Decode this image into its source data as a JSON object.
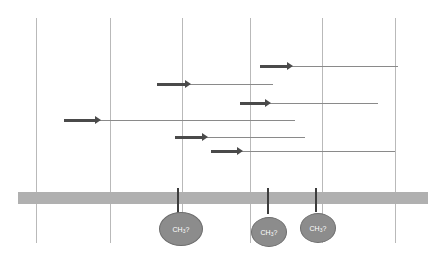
{
  "figure": {
    "type": "sequencing-coverage-diagram",
    "background_color": "#ffffff",
    "width": 444,
    "height": 261
  },
  "gridlines": {
    "color": "#b9b9b9",
    "top": 18,
    "bottom": 243,
    "positions": [
      36,
      110,
      182,
      250,
      322,
      395
    ]
  },
  "membrane": {
    "name": "reference-genome-bar",
    "color": "#b0b0b0",
    "x": 18,
    "y": 192,
    "width": 410,
    "height": 12
  },
  "reads": [
    {
      "id": "read-1",
      "y": 67,
      "tail_start": 260,
      "tail_end": 398,
      "head_start": 260,
      "head_end": 292,
      "direction": "right"
    },
    {
      "id": "read-2",
      "y": 85,
      "tail_start": 157,
      "tail_end": 273,
      "head_start": 157,
      "head_end": 190,
      "direction": "right"
    },
    {
      "id": "read-3",
      "y": 104,
      "tail_start": 240,
      "tail_end": 378,
      "head_start": 240,
      "head_end": 270,
      "direction": "right"
    },
    {
      "id": "read-4",
      "y": 121,
      "tail_start": 64,
      "tail_end": 295,
      "head_start": 64,
      "head_end": 100,
      "direction": "right"
    },
    {
      "id": "read-5",
      "y": 138,
      "tail_start": 175,
      "tail_end": 305,
      "head_start": 175,
      "head_end": 207,
      "direction": "right"
    },
    {
      "id": "read-6",
      "y": 152,
      "tail_start": 211,
      "tail_end": 395,
      "head_start": 211,
      "head_end": 242,
      "direction": "right"
    }
  ],
  "modifications": [
    {
      "id": "mod-1",
      "stem_x": 177,
      "stem_top": 188,
      "stem_bottom": 214,
      "oval_cx": 180,
      "oval_cy": 228,
      "oval_rx": 21,
      "oval_ry": 16,
      "label_prefix": "CH",
      "label_sub": "3",
      "label_suffix": "?"
    },
    {
      "id": "mod-2",
      "stem_x": 267,
      "stem_top": 188,
      "stem_bottom": 214,
      "oval_cx": 268,
      "oval_cy": 231,
      "oval_rx": 17,
      "oval_ry": 14,
      "label_prefix": "CH",
      "label_sub": "3",
      "label_suffix": "?"
    },
    {
      "id": "mod-3",
      "stem_x": 315,
      "stem_top": 188,
      "stem_bottom": 212,
      "oval_cx": 317,
      "oval_cy": 227,
      "oval_rx": 17,
      "oval_ry": 14,
      "label_prefix": "CH",
      "label_sub": "3",
      "label_suffix": "?"
    }
  ],
  "colors": {
    "gridline": "#b9b9b9",
    "membrane": "#b0b0b0",
    "read_tail": "#8a8a8a",
    "read_head": "#4a4a4a",
    "stem": "#3d3d3d",
    "oval_fill": "#8c8c8c",
    "oval_stroke": "#6e6e6e",
    "oval_text": "#ffffff"
  }
}
